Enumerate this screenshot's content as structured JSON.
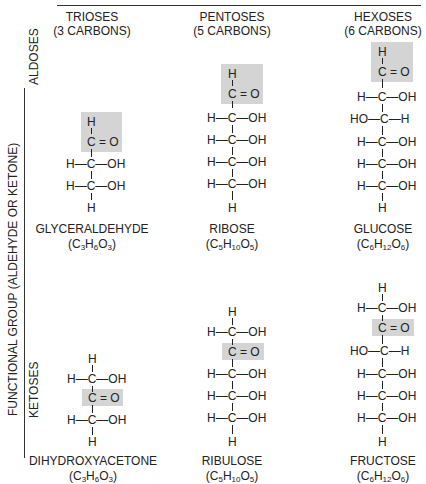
{
  "columns": [
    {
      "title": "TRIOSES",
      "subtitle": "(3 CARBONS)"
    },
    {
      "title": "PENTOSES",
      "subtitle": "(5 CARBONS)"
    },
    {
      "title": "HEXOSES",
      "subtitle": "(6 CARBONS)"
    }
  ],
  "row_axis_label": "FUNCTIONAL GROUP (ALDEHYDE OR KETONE)",
  "rows": [
    {
      "label": "ALDOSES"
    },
    {
      "label": "KETOSES"
    }
  ],
  "molecules": {
    "glyceraldehyde": {
      "name": "GLYCERALDEHYDE",
      "formula": "(C3H6O3)",
      "formula_parts": [
        "C",
        "3",
        "H",
        "6",
        "O",
        "3"
      ]
    },
    "ribose": {
      "name": "RIBOSE",
      "formula": "(C5H10O5)",
      "formula_parts": [
        "C",
        "5",
        "H",
        "10",
        "O",
        "5"
      ]
    },
    "glucose": {
      "name": "GLUCOSE",
      "formula": "(C6H12O6)",
      "formula_parts": [
        "C",
        "6",
        "H",
        "12",
        "O",
        "6"
      ]
    },
    "dihydroxyacetone": {
      "name": "DIHYDROXYACETONE",
      "formula": "(C3H6O3)",
      "formula_parts": [
        "C",
        "3",
        "H",
        "6",
        "O",
        "3"
      ]
    },
    "ribulose": {
      "name": "RIBULOSE",
      "formula": "(C5H10O5)",
      "formula_parts": [
        "C",
        "5",
        "H",
        "10",
        "O",
        "5"
      ]
    },
    "fructose": {
      "name": "FRUCTOSE",
      "formula": "(C6H12O6)",
      "formula_parts": [
        "C",
        "6",
        "H",
        "12",
        "O",
        "6"
      ]
    }
  },
  "atoms": {
    "H": "H",
    "C": "C",
    "CO": "C = O",
    "OH": "OH",
    "HO": "HO",
    "dash": "—"
  },
  "colors": {
    "highlight": "#d4d4d4",
    "text": "#222222"
  }
}
